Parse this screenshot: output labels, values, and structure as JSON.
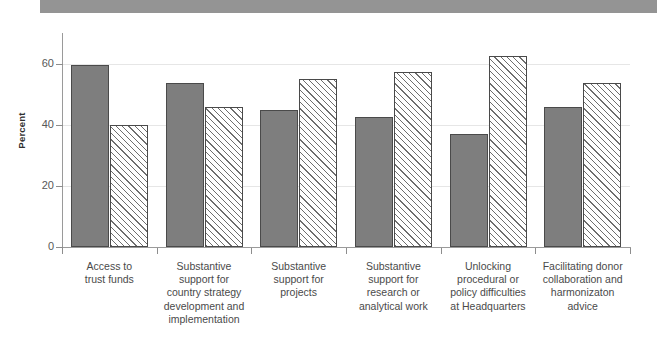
{
  "header": {
    "band_text": ""
  },
  "chart_data": {
    "type": "bar",
    "title": "",
    "subtitle": "",
    "xlabel": "",
    "ylabel": "Percent",
    "ylim": [
      0,
      70
    ],
    "yticks": [
      0,
      20,
      40,
      60
    ],
    "ytick_labels": [
      "0",
      "20",
      "40",
      "60"
    ],
    "grid": true,
    "legend": "none",
    "categories": [
      "Access to\ntrust funds",
      "Substantive\nsupport for\ncountry strategy\ndevelopment and\nimplementation",
      "Substantive\nsupport for\nprojects",
      "Substantive\nsupport for\nresearch or\nanalytical work",
      "Unlocking\nprocedural or\npolicy difficulties\nat Headquarters",
      "Facilitating donor\ncollaboration and\nharmonizaton\nadvice"
    ],
    "category_lines": [
      [
        "Access to",
        "trust funds"
      ],
      [
        "Substantive",
        "support for",
        "country strategy",
        "development and",
        "implementation"
      ],
      [
        "Substantive",
        "support for",
        "projects"
      ],
      [
        "Substantive",
        "support for",
        "research or",
        "analytical work"
      ],
      [
        "Unlocking",
        "procedural or",
        "policy difficulties",
        "at Headquarters"
      ],
      [
        "Facilitating donor",
        "collaboration and",
        "harmonizaton",
        "advice"
      ]
    ],
    "series": [
      {
        "name": "series-solid",
        "style": "solid-gray",
        "color": "#7e7e7e",
        "values": [
          59.5,
          53.5,
          44.8,
          42.5,
          37.0,
          45.7
        ]
      },
      {
        "name": "series-hatched",
        "style": "diagonal-hatch",
        "color": "#ffffff",
        "values": [
          39.9,
          45.7,
          54.8,
          57.2,
          62.5,
          53.7
        ]
      }
    ]
  },
  "colors": {
    "solid_bar": "#7e7e7e",
    "bar_border": "#4a4a4a",
    "gridline": "#e6e6e6",
    "axis": "#9a9a9a",
    "header_band": "#949494"
  }
}
